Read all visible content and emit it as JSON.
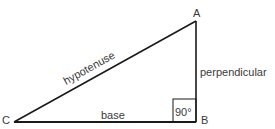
{
  "diagram": {
    "vertices": [
      {
        "label": "A",
        "x": 196,
        "y": 21
      },
      {
        "label": "B",
        "x": 196,
        "y": 122
      },
      {
        "label": "C",
        "x": 14,
        "y": 122
      }
    ],
    "sides": {
      "hypotenuse": "hypotenuse",
      "perpendicular": "perpendicular",
      "base": "base"
    },
    "right_angle_label": "90°",
    "colors": {
      "stroke": "#1a1a1a",
      "text": "#3a3a3a",
      "background": "#ffffff"
    }
  }
}
